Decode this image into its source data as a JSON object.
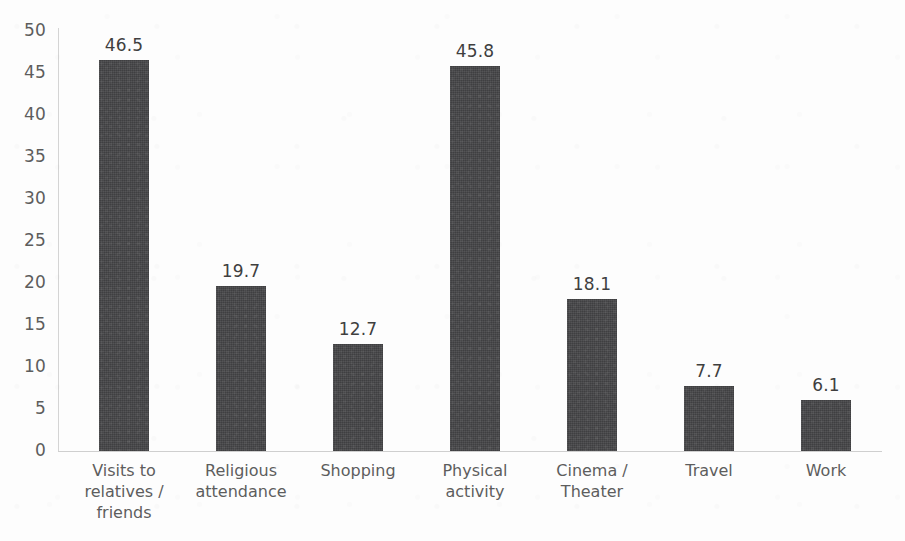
{
  "chart_data": {
    "type": "bar",
    "title": "",
    "subtitle": "",
    "xlabel": "",
    "ylabel": "",
    "categories": [
      "Visits to\nrelatives /\nfriends",
      "Religious\nattendance",
      "Shopping",
      "Physical\nactivity",
      "Cinema /\nTheater",
      "Travel",
      "Work"
    ],
    "values": [
      46.5,
      19.7,
      12.7,
      45.8,
      18.1,
      7.7,
      6.1
    ],
    "value_labels": [
      "46.5",
      "19.7",
      "12.7",
      "45.8",
      "18.1",
      "7.7",
      "6.1"
    ],
    "ylim": [
      0,
      50
    ],
    "ytick_step": 5,
    "ytick_labels": [
      "50",
      "45",
      "40",
      "35",
      "30",
      "25",
      "20",
      "15",
      "10",
      "5",
      "0"
    ],
    "grid": false,
    "legend": null,
    "legend_position": "none",
    "bar_color": "#454547",
    "axis_color": "#d4d4d4",
    "label_color": "#5d5d5d",
    "background_color": "#ffffff"
  }
}
